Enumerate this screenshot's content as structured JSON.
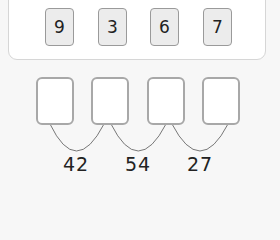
{
  "digit_tiles": [
    {
      "value": "9"
    },
    {
      "value": "3"
    },
    {
      "value": "6"
    },
    {
      "value": "7"
    }
  ],
  "answer_boxes": [
    {
      "value": ""
    },
    {
      "value": ""
    },
    {
      "value": ""
    },
    {
      "value": ""
    }
  ],
  "pair_sums": [
    {
      "value": "42"
    },
    {
      "value": "54"
    },
    {
      "value": "27"
    }
  ],
  "colors": {
    "tile_fill": "#ececec",
    "tile_border": "#9a9a9a",
    "box_border": "#a8a8a8",
    "arc_stroke": "#777777",
    "text": "#222222"
  }
}
